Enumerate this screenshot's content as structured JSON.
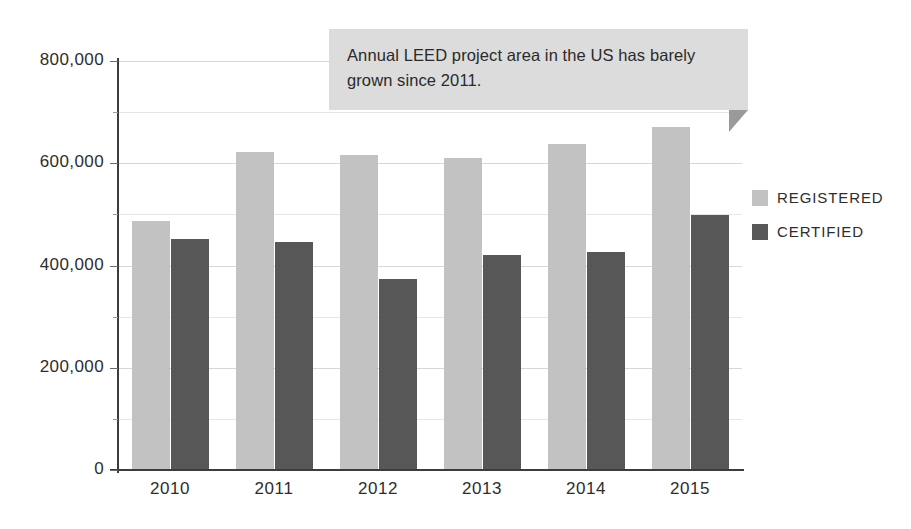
{
  "chart_data": {
    "type": "bar",
    "title": "",
    "xlabel": "",
    "ylabel": "",
    "categories": [
      "2010",
      "2011",
      "2012",
      "2013",
      "2014",
      "2015"
    ],
    "series": [
      {
        "name": "REGISTERED",
        "color": "#c2c2c2",
        "values": [
          488000,
          622000,
          616000,
          610000,
          637000,
          670000
        ]
      },
      {
        "name": "CERTIFIED",
        "color": "#575757",
        "values": [
          451000,
          446000,
          373000,
          420000,
          426000,
          498000
        ]
      }
    ],
    "ylim": [
      0,
      800000
    ],
    "ytick_labels": [
      "0",
      "200,000",
      "400,000",
      "600,000",
      "800,000"
    ],
    "ytick_values": [
      0,
      200000,
      400000,
      600000,
      800000
    ],
    "minor_ytick_values": [
      100000,
      300000,
      500000,
      700000
    ],
    "grid": true,
    "legend_position": "right",
    "annotations": [
      {
        "text": "Annual LEED project area in the US has barely grown since 2011."
      }
    ]
  },
  "callout": {
    "text": "Annual LEED project area in the US has barely grown since 2011."
  },
  "legend": {
    "items": [
      {
        "label": "REGISTERED"
      },
      {
        "label": "CERTIFIED"
      }
    ]
  }
}
